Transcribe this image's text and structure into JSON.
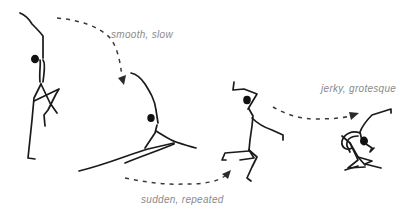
{
  "diagram": {
    "type": "movement-sequence-illustration",
    "colors": {
      "figure_stroke": "#1a1a1a",
      "arrow": "#3a3a3a",
      "label_text": "#8a8a8a",
      "background": "#ffffff"
    },
    "figures": [
      {
        "id": "figure-1",
        "pose": "standing-arm-raised"
      },
      {
        "id": "figure-2",
        "pose": "lunge-leaning-back"
      },
      {
        "id": "figure-3",
        "pose": "leaping-jagged"
      },
      {
        "id": "figure-4",
        "pose": "crouched-contorted"
      }
    ],
    "transitions": [
      {
        "from": "figure-1",
        "to": "figure-2",
        "label": "smooth, slow"
      },
      {
        "from": "figure-2",
        "to": "figure-3",
        "label": "sudden, repeated"
      },
      {
        "from": "figure-3",
        "to": "figure-4",
        "label": "jerky, grotesque"
      }
    ]
  }
}
